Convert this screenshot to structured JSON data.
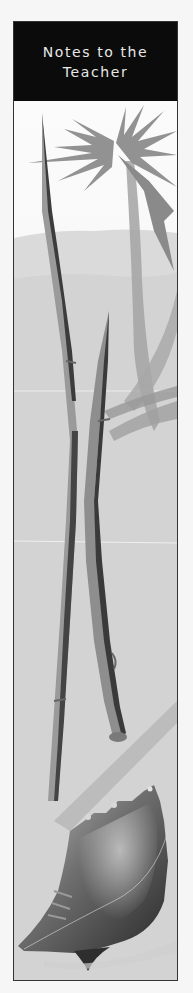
{
  "panel": {
    "title_line1": "Notes to the",
    "title_line2": "Teacher"
  },
  "illustration": {
    "description": "Grayscale beach scene: palm tree, two crossed bamboo/sugarcane stalks, conch shell on sand",
    "elements": [
      "palm-tree",
      "bamboo-stalks",
      "conch-shell",
      "sand-dunes"
    ]
  },
  "colors": {
    "header_bg": "#0b0b0b",
    "header_text": "#e8e8e8",
    "border": "#333333",
    "sand": "#d2d2d2",
    "palm": "#8f8f8f"
  }
}
